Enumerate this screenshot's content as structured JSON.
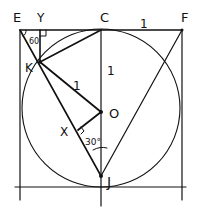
{
  "diagram": {
    "type": "geometry-figure",
    "points": {
      "E": {
        "label": "E",
        "x": 20,
        "y": 30
      },
      "Y": {
        "label": "Y",
        "x": 40,
        "y": 30
      },
      "C": {
        "label": "C",
        "x": 101,
        "y": 30
      },
      "F": {
        "label": "F",
        "x": 182,
        "y": 30
      },
      "K": {
        "label": "K",
        "x": 40,
        "y": 62
      },
      "O": {
        "label": "O",
        "x": 101,
        "y": 112
      },
      "X": {
        "label": "X",
        "x": 78,
        "y": 130
      },
      "J": {
        "label": "J",
        "x": 101,
        "y": 176
      }
    },
    "annotations": {
      "cf_length": "1",
      "co_length": "1",
      "ko_length": "1",
      "angle_e": "60",
      "angle_j": "30°"
    },
    "colors": {
      "ink": "#111111",
      "background": "#ffffff"
    }
  }
}
